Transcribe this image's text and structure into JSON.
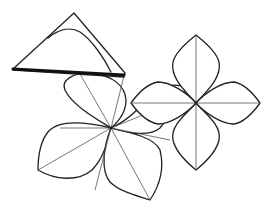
{
  "diagram": {
    "title": "",
    "elements": [
      {
        "id": "folded-triangle",
        "label": ""
      },
      {
        "id": "left-flower",
        "petals": 4,
        "crease_lines": 4
      },
      {
        "id": "right-flower",
        "petals": 4,
        "crease_lines": 2
      }
    ],
    "colors": {
      "line": "#222222",
      "background": "#ffffff"
    }
  }
}
